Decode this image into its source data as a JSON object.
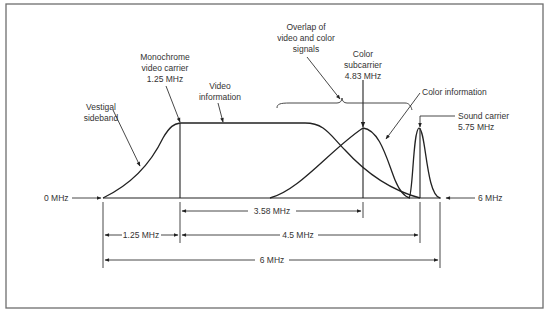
{
  "diagram": {
    "colors": {
      "ink": "#222222",
      "frame": "#6e6e6e",
      "background": "#ffffff"
    },
    "labels": {
      "vestigal": [
        "Vestigal",
        "sideband"
      ],
      "mono_carrier": [
        "Monochrome",
        "video carrier",
        "1.25 MHz"
      ],
      "video_info": [
        "Video",
        "information"
      ],
      "overlap": [
        "Overlap of",
        "video and color",
        "signals"
      ],
      "color_sub": [
        "Color",
        "subcarrier",
        "4.83 MHz"
      ],
      "color_info": "Color information",
      "sound": [
        "Sound carrier",
        "5.75 MHz"
      ],
      "zero": "0 MHz",
      "six": "6 MHz"
    },
    "dimensions": {
      "d358": "3.58 MHz",
      "d125": "1.25 MHz",
      "d45": "4.5 MHz",
      "d6": "6 MHz"
    },
    "frequencies_mhz": {
      "band_start": 0,
      "mono_video_carrier": 1.25,
      "color_subcarrier": 4.83,
      "sound_carrier": 5.75,
      "band_end": 6
    }
  }
}
